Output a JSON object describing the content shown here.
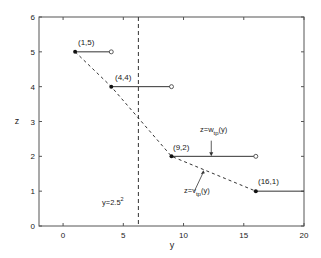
{
  "chart_data": {
    "type": "line",
    "title": "",
    "xlabel": "y",
    "ylabel": "z",
    "xlim": [
      -2,
      20
    ],
    "ylim": [
      0,
      6
    ],
    "xticks": [
      0,
      5,
      10,
      15,
      20
    ],
    "yticks": [
      0,
      1,
      2,
      3,
      4,
      5,
      6
    ],
    "xtick_labels": [
      "0",
      "5",
      "10",
      "15",
      "20"
    ],
    "ytick_labels": [
      "0",
      "1",
      "2",
      "3",
      "4",
      "5",
      "6"
    ],
    "grid": false,
    "series": [
      {
        "name": "z=v_tp(y)",
        "style": "dashed",
        "points": [
          [
            1,
            5
          ],
          [
            4,
            4
          ],
          [
            9,
            2
          ],
          [
            16,
            1
          ]
        ]
      },
      {
        "name": "z=w_tp(y)",
        "style": "step-segments",
        "segments": [
          {
            "start": [
              1,
              5
            ],
            "end": [
              4,
              5
            ],
            "start_closed": true,
            "end_closed": false
          },
          {
            "start": [
              4,
              4
            ],
            "end": [
              9,
              4
            ],
            "start_closed": true,
            "end_closed": false
          },
          {
            "start": [
              9,
              2
            ],
            "end": [
              16,
              2
            ],
            "start_closed": true,
            "end_closed": false
          },
          {
            "start": [
              16,
              1
            ],
            "end": [
              20,
              1
            ],
            "start_closed": true,
            "end_closed": null
          }
        ]
      }
    ],
    "reference_lines": [
      {
        "orientation": "vertical",
        "x": 6.25,
        "style": "dashed",
        "label": "y=2.5²"
      }
    ],
    "annotations": [
      {
        "text": "(1,5)",
        "x": 1,
        "y": 5
      },
      {
        "text": "(4,4)",
        "x": 4,
        "y": 4
      },
      {
        "text": "(9,2)",
        "x": 9,
        "y": 2
      },
      {
        "text": "(16,1)",
        "x": 16,
        "y": 1
      },
      {
        "text": "z=w_tp(y)",
        "arrow_to": [
          12.3,
          2
        ]
      },
      {
        "text": "z=v_tp(y)",
        "arrow_to": [
          11.6,
          1.6
        ]
      },
      {
        "text": "y=2.5²",
        "x": 3.2,
        "y": 0.65
      }
    ]
  },
  "labels": {
    "xlabel": "y",
    "ylabel": "z",
    "p1": "(1,5)",
    "p2": "(4,4)",
    "p3": "(9,2)",
    "p4": "(16,1)",
    "w_prefix": "z=w",
    "w_sub": "tp",
    "w_suffix": "(y)",
    "v_prefix": "z=v",
    "v_sub": "tp",
    "v_suffix": "(y)",
    "ref_base": "y=2.5",
    "ref_sup": "2"
  }
}
